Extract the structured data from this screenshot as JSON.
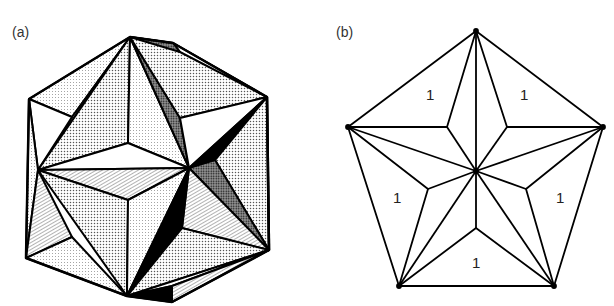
{
  "figure": {
    "panels": [
      {
        "id": "a",
        "label": "(a)",
        "description": "Shaded perspective drawing of a stellated icosahedron-like polyhedron"
      },
      {
        "id": "b",
        "label": "(b)",
        "description": "Pentagon net subdivided by a five-pointed star with face labels",
        "face_labels": [
          "1",
          "1",
          "1",
          "1",
          "1"
        ]
      }
    ]
  }
}
